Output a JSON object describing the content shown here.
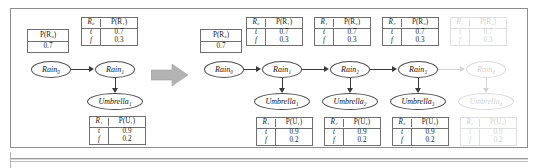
{
  "figure": {
    "transition_arrow": "rightwards-block-arrow"
  },
  "colors": {
    "ink": "#1a1a1a",
    "rule": "#6f6f6f",
    "frame": "#8d8d8d",
    "block_arrow": "#b0b0b0",
    "faded": "#cfcfcf"
  },
  "labels": {
    "t": "t",
    "f": "f"
  },
  "left_panel": {
    "prior_table": {
      "header": "P(R₀)",
      "value": "0.7"
    },
    "transition_table": {
      "col1": "R₀",
      "col2": "P(R₁)",
      "rows": [
        {
          "key": "t",
          "value": "0.7"
        },
        {
          "key": "f",
          "value": "0.3"
        }
      ]
    },
    "sensor_table": {
      "col1": "R₁",
      "col2": "P(U₁)",
      "rows": [
        {
          "key": "t",
          "value": "0.9"
        },
        {
          "key": "f",
          "value": "0.2"
        }
      ]
    },
    "nodes": [
      {
        "label": "Rain₀",
        "type": "rain"
      },
      {
        "label": "Rain₁",
        "type": "rain"
      },
      {
        "label": "Umbrella₁",
        "type": "umbrella"
      }
    ]
  },
  "right_panel": {
    "prior_table": {
      "header": "P(R₀)",
      "value": "0.7"
    },
    "transition_tables": [
      {
        "col1": "R₀",
        "col2": "P(R₁)",
        "rows": [
          {
            "key": "t",
            "value": "0.7"
          },
          {
            "key": "f",
            "value": "0.3"
          }
        ],
        "faded": false
      },
      {
        "col1": "R₁",
        "col2": "P(R₂)",
        "rows": [
          {
            "key": "t",
            "value": "0.7"
          },
          {
            "key": "f",
            "value": "0.3"
          }
        ],
        "faded": false
      },
      {
        "col1": "R₂",
        "col2": "P(R₃)",
        "rows": [
          {
            "key": "t",
            "value": "0.7"
          },
          {
            "key": "f",
            "value": "0.3"
          }
        ],
        "faded": false
      },
      {
        "col1": "R₃",
        "col2": "P(R₄)",
        "rows": [
          {
            "key": "t",
            "value": "0.7"
          },
          {
            "key": "f",
            "value": "0.3"
          }
        ],
        "faded": true
      }
    ],
    "sensor_tables": [
      {
        "col1": "R₁",
        "col2": "P(U₁)",
        "rows": [
          {
            "key": "t",
            "value": "0.9"
          },
          {
            "key": "f",
            "value": "0.2"
          }
        ],
        "faded": false
      },
      {
        "col1": "R₂",
        "col2": "P(U₂)",
        "rows": [
          {
            "key": "t",
            "value": "0.9"
          },
          {
            "key": "f",
            "value": "0.2"
          }
        ],
        "faded": false
      },
      {
        "col1": "R₃",
        "col2": "P(U₃)",
        "rows": [
          {
            "key": "t",
            "value": "0.9"
          },
          {
            "key": "f",
            "value": "0.2"
          }
        ],
        "faded": false
      },
      {
        "col1": "R₄",
        "col2": "P(U₄)",
        "rows": [
          {
            "key": "t",
            "value": "0.9"
          },
          {
            "key": "f",
            "value": "0.2"
          }
        ],
        "faded": true
      }
    ],
    "rain_nodes": [
      {
        "label": "Rain₀",
        "faded": false
      },
      {
        "label": "Rain₁",
        "faded": false
      },
      {
        "label": "Rain₂",
        "faded": false
      },
      {
        "label": "Rain₃",
        "faded": false
      },
      {
        "label": "Rain₄",
        "faded": true
      }
    ],
    "umbrella_nodes": [
      {
        "label": "Umbrella₁",
        "faded": false
      },
      {
        "label": "Umbrella₂",
        "faded": false
      },
      {
        "label": "Umbrella₃",
        "faded": false
      },
      {
        "label": "Umbrella₄",
        "faded": true
      }
    ]
  }
}
